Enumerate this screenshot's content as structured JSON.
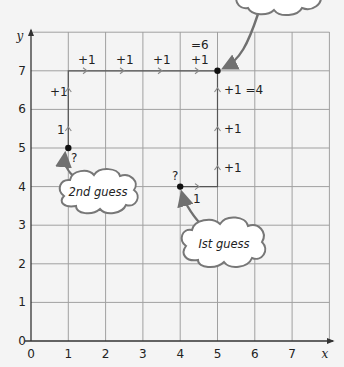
{
  "axes": {
    "x_label": "x",
    "y_label": "y",
    "x_ticks": [
      "0",
      "1",
      "2",
      "3",
      "4",
      "5",
      "6",
      "7"
    ],
    "y_ticks": [
      "0",
      "1",
      "2",
      "3",
      "4",
      "5",
      "6",
      "7"
    ],
    "x_range": [
      0,
      8
    ],
    "y_range": [
      0,
      8
    ]
  },
  "points": [
    {
      "name": "first-guess-point",
      "x": 4,
      "y": 4,
      "mark": "?"
    },
    {
      "name": "second-guess-point",
      "x": 1,
      "y": 5,
      "mark": "?"
    },
    {
      "name": "answer-point",
      "x": 5,
      "y": 7
    }
  ],
  "path_labels": {
    "first_step_right": "1",
    "up_1": "+1",
    "up_2": "+1",
    "up_3": "+1 =4",
    "second_up_1": "1",
    "second_up_2": "+1",
    "right_1": "+1",
    "right_2": "+1",
    "right_3": "+1",
    "right_4": "+1",
    "right_total": "=6"
  },
  "clouds": {
    "first": "Ist guess",
    "second": "2nd guess",
    "top": ""
  },
  "colors": {
    "grid": "#9a9a9a",
    "axis": "#333333",
    "arrow": "#707070",
    "cloud_stroke": "#777777",
    "background": "#f4f4f4"
  }
}
